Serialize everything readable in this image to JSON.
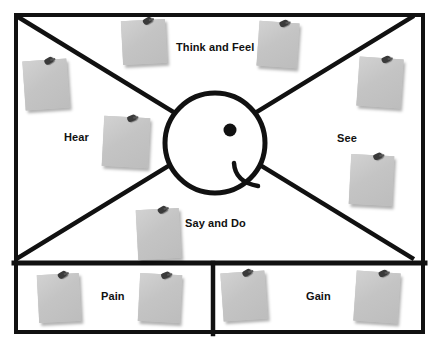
{
  "diagram": {
    "type": "empathy-map",
    "background_color": "#ffffff",
    "line_color": "#111111",
    "note_color": "#c6c6c6",
    "pin_color": "#3a3a3a"
  },
  "quadrants": [
    {
      "id": "think-and-feel",
      "label": "Think and Feel",
      "position": "top",
      "label_x": 176,
      "label_y": 42
    },
    {
      "id": "hear",
      "label": "Hear",
      "position": "left",
      "label_x": 64,
      "label_y": 132
    },
    {
      "id": "see",
      "label": "See",
      "position": "right",
      "label_x": 337,
      "label_y": 133
    },
    {
      "id": "say-and-do",
      "label": "Say and Do",
      "position": "bottom",
      "label_x": 185,
      "label_y": 218
    }
  ],
  "panels": [
    {
      "id": "pain",
      "label": "Pain",
      "position": "bottom-left",
      "label_x": 101,
      "label_y": 291
    },
    {
      "id": "gain",
      "label": "Gain",
      "position": "bottom-right",
      "label_x": 306,
      "label_y": 291
    }
  ],
  "persona_head": {
    "id": "persona-face",
    "shape": "circle-profile",
    "center_x": 215,
    "center_y": 143,
    "radius": 50,
    "eye": {
      "x": 230,
      "y": 130,
      "radius": 6
    },
    "mouth": "curved-smile"
  },
  "notes": [
    {
      "id": "note-think-1",
      "quadrant": "think-and-feel",
      "x": 122,
      "y": 20,
      "w": 44,
      "h": 44,
      "rotate": -3
    },
    {
      "id": "note-think-2",
      "quadrant": "think-and-feel",
      "x": 258,
      "y": 22,
      "w": 40,
      "h": 45,
      "rotate": 4
    },
    {
      "id": "note-hear-1",
      "quadrant": "hear",
      "x": 24,
      "y": 60,
      "w": 44,
      "h": 49,
      "rotate": -4
    },
    {
      "id": "note-hear-2",
      "quadrant": "hear",
      "x": 103,
      "y": 117,
      "w": 46,
      "h": 50,
      "rotate": 3
    },
    {
      "id": "note-see-1",
      "quadrant": "see",
      "x": 358,
      "y": 58,
      "w": 44,
      "h": 49,
      "rotate": 4
    },
    {
      "id": "note-see-2",
      "quadrant": "see",
      "x": 350,
      "y": 155,
      "w": 43,
      "h": 50,
      "rotate": 3
    },
    {
      "id": "note-say-1",
      "quadrant": "say-and-do",
      "x": 137,
      "y": 209,
      "w": 43,
      "h": 50,
      "rotate": -3
    },
    {
      "id": "note-pain-1",
      "quadrant": "pain",
      "x": 38,
      "y": 274,
      "w": 42,
      "h": 48,
      "rotate": -3
    },
    {
      "id": "note-pain-2",
      "quadrant": "pain",
      "x": 139,
      "y": 274,
      "w": 42,
      "h": 48,
      "rotate": 3
    },
    {
      "id": "note-gain-1",
      "quadrant": "gain",
      "x": 222,
      "y": 272,
      "w": 44,
      "h": 48,
      "rotate": -4
    },
    {
      "id": "note-gain-2",
      "quadrant": "gain",
      "x": 355,
      "y": 272,
      "w": 44,
      "h": 50,
      "rotate": 4
    }
  ]
}
